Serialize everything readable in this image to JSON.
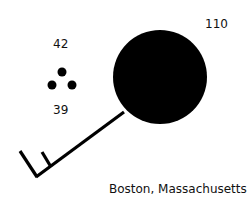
{
  "station_model": {
    "location": "Boston, Massachusetts",
    "temperature": "42",
    "dew_point": "39",
    "pressure": "110",
    "present_weather": "moderate-rain-dots-icon",
    "sky_cover": "overcast-filled-circle",
    "wind_barb": "wind-barb-icon",
    "colors": {
      "symbol": "#000000",
      "background": "#ffffff"
    }
  }
}
